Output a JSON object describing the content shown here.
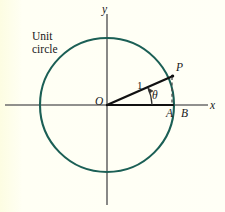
{
  "figure": {
    "kind": "unit-circle-trigonometry-diagram",
    "background_color": "#fffff2",
    "labels": {
      "unit_circle_line1": "Unit",
      "unit_circle_line2": "circle",
      "y_axis": "y",
      "x_axis": "x",
      "origin": "O",
      "radius_length": "1",
      "point_p": "P",
      "point_a": "A",
      "point_b": "B",
      "angle_theta": "θ"
    },
    "colors": {
      "circle_stroke": "#1b5f55",
      "axis_stroke": "#6b6b6b",
      "radius_stroke": "#111111",
      "dashed_stroke": "#4a4a4a",
      "text": "#17181a"
    },
    "geometry": {
      "center_x": 107,
      "center_y": 105,
      "radius_px": 67,
      "point_p_x": 172,
      "point_p_y": 76,
      "point_a_x": 172,
      "point_a_y": 105,
      "point_b_x": 174,
      "point_b_y": 105,
      "angle_degrees": 24
    }
  }
}
